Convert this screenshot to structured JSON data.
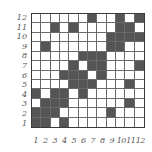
{
  "diagram": {
    "type": "binary-grid",
    "rows": 12,
    "cols": 12,
    "colors": {
      "filled": "#555555",
      "empty": "#ffffff",
      "grid_line": "#6a6a6a",
      "label": "#555555"
    },
    "y_labels": [
      "12",
      "11",
      "10",
      "9",
      "8",
      "7",
      "6",
      "5",
      "4",
      "3",
      "2",
      "1"
    ],
    "x_labels": [
      "1",
      "2",
      "3",
      "4",
      "5",
      "6",
      "7",
      "8",
      "9",
      "10",
      "11",
      "12"
    ],
    "filled_cells_by_row": {
      "12": [
        7,
        10,
        12
      ],
      "11": [
        3,
        5,
        10,
        11
      ],
      "10": [
        9,
        10,
        11,
        12
      ],
      "9": [
        2,
        9,
        10
      ],
      "8": [
        6,
        7,
        8
      ],
      "7": [
        5,
        7,
        8,
        12
      ],
      "6": [
        4,
        5,
        6,
        8
      ],
      "5": [
        5,
        6,
        7,
        11
      ],
      "4": [
        1,
        3,
        4,
        6
      ],
      "3": [
        2,
        3,
        4,
        11
      ],
      "2": [
        1,
        2,
        3,
        9
      ],
      "1": [
        1,
        2,
        4
      ]
    }
  }
}
